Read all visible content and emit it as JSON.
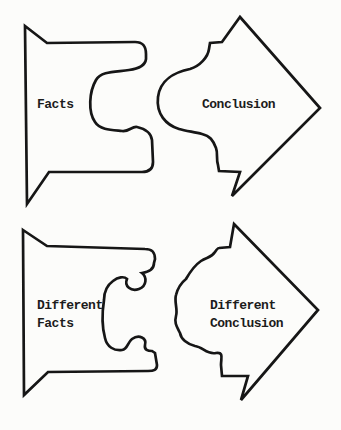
{
  "diagram": {
    "title_semantic": "facts-to-conclusion-puzzle-arrows",
    "top_row": {
      "left_piece": {
        "label": "Facts"
      },
      "right_piece": {
        "label": "Conclusion"
      }
    },
    "bottom_row": {
      "left_piece": {
        "label_line1": "Different",
        "label_line2": "Facts"
      },
      "right_piece": {
        "label_line1": "Different",
        "label_line2": "Conclusion"
      }
    }
  },
  "colors": {
    "background": "#fcfcfa",
    "line": "#161616",
    "text": "#1c1c1c"
  }
}
